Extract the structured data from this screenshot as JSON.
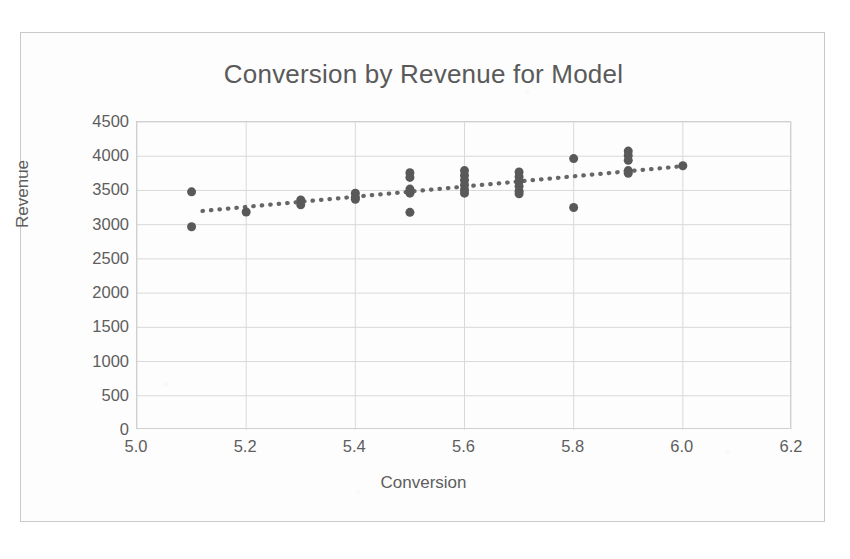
{
  "chart_data": {
    "type": "scatter",
    "title": "Conversion by Revenue for Model",
    "xlabel": "Conversion",
    "ylabel": "Revenue",
    "xlim": [
      5.0,
      6.2
    ],
    "ylim": [
      0,
      4500
    ],
    "xticks": [
      "5.0",
      "5.2",
      "5.4",
      "5.6",
      "5.8",
      "6.0",
      "6.2"
    ],
    "xtick_values": [
      5.0,
      5.2,
      5.4,
      5.6,
      5.8,
      6.0,
      6.2
    ],
    "yticks": [
      "0",
      "500",
      "1000",
      "1500",
      "2000",
      "2500",
      "3000",
      "3500",
      "4000",
      "4500"
    ],
    "ytick_values": [
      0,
      500,
      1000,
      1500,
      2000,
      2500,
      3000,
      3500,
      4000,
      4500
    ],
    "grid": true,
    "grid_color": "#d9d9d9",
    "legend": false,
    "marker_color": "#595959",
    "marker_shape": "circle",
    "marker_size": 9,
    "points": [
      {
        "x": 5.1,
        "y": 3480
      },
      {
        "x": 5.1,
        "y": 2970
      },
      {
        "x": 5.2,
        "y": 3185
      },
      {
        "x": 5.3,
        "y": 3360
      },
      {
        "x": 5.3,
        "y": 3290
      },
      {
        "x": 5.4,
        "y": 3460
      },
      {
        "x": 5.4,
        "y": 3400
      },
      {
        "x": 5.4,
        "y": 3370
      },
      {
        "x": 5.5,
        "y": 3760
      },
      {
        "x": 5.5,
        "y": 3690
      },
      {
        "x": 5.5,
        "y": 3520
      },
      {
        "x": 5.5,
        "y": 3460
      },
      {
        "x": 5.5,
        "y": 3180
      },
      {
        "x": 5.6,
        "y": 3790
      },
      {
        "x": 5.6,
        "y": 3720
      },
      {
        "x": 5.6,
        "y": 3650
      },
      {
        "x": 5.6,
        "y": 3580
      },
      {
        "x": 5.6,
        "y": 3510
      },
      {
        "x": 5.6,
        "y": 3460
      },
      {
        "x": 5.7,
        "y": 3770
      },
      {
        "x": 5.7,
        "y": 3700
      },
      {
        "x": 5.7,
        "y": 3630
      },
      {
        "x": 5.7,
        "y": 3560
      },
      {
        "x": 5.7,
        "y": 3490
      },
      {
        "x": 5.7,
        "y": 3450
      },
      {
        "x": 5.8,
        "y": 3965
      },
      {
        "x": 5.8,
        "y": 3250
      },
      {
        "x": 5.9,
        "y": 4075
      },
      {
        "x": 5.9,
        "y": 4010
      },
      {
        "x": 5.9,
        "y": 3940
      },
      {
        "x": 5.9,
        "y": 3790
      },
      {
        "x": 5.9,
        "y": 3750
      },
      {
        "x": 6.0,
        "y": 3860
      }
    ],
    "trendline": {
      "label": "linear-trendline",
      "style": "dotted",
      "color": "#666666",
      "x_start": 5.12,
      "y_start": 3200,
      "x_end": 6.0,
      "y_end": 3855
    }
  }
}
